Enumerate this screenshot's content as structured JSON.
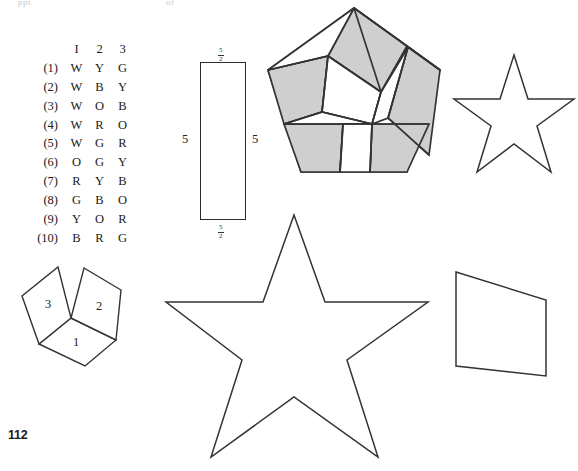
{
  "page": {
    "number": "112",
    "running_head_left": "ppt",
    "running_head_right": "of"
  },
  "code_table": {
    "name": "color-code-table",
    "headers": [
      "",
      "I",
      "2",
      "3"
    ],
    "rows": [
      {
        "label": "(1)",
        "values": [
          "W",
          "Y",
          "G"
        ]
      },
      {
        "label": "(2)",
        "values": [
          "W",
          "B",
          "Y"
        ]
      },
      {
        "label": "(3)",
        "values": [
          "W",
          "O",
          "B"
        ]
      },
      {
        "label": "(4)",
        "values": [
          "W",
          "R",
          "O"
        ]
      },
      {
        "label": "(5)",
        "values": [
          "W",
          "G",
          "R"
        ]
      },
      {
        "label": "(6)",
        "values": [
          "O",
          "G",
          "Y"
        ]
      },
      {
        "label": "(7)",
        "values": [
          "R",
          "Y",
          "B"
        ]
      },
      {
        "label": "(8)",
        "values": [
          "G",
          "B",
          "O"
        ]
      },
      {
        "label": "(9)",
        "values": [
          "Y",
          "O",
          "R"
        ]
      },
      {
        "label": "(10)",
        "values": [
          "B",
          "R",
          "G"
        ]
      }
    ]
  },
  "rectangle": {
    "label_left": "5",
    "label_right": "5",
    "label_top_numerator": "5",
    "label_top_denominator": "2",
    "label_bottom_numerator": "5",
    "label_bottom_denominator": "2"
  },
  "rhombi": {
    "labels": [
      "1",
      "2",
      "3"
    ]
  },
  "colors": {
    "ink": "#2b2b2b",
    "shaded_fill": "#cfcfcf",
    "unshaded_fill": "#ffffff",
    "paper": "#ffffff"
  },
  "figures": [
    {
      "name": "dissected-pentagon",
      "type": "pentagon-dissection",
      "shaded_pieces": 5,
      "unshaded_pieces": 6
    },
    {
      "name": "small-five-pointed-star",
      "type": "star",
      "points": 5
    },
    {
      "name": "large-five-pointed-star",
      "type": "star",
      "points": 5
    },
    {
      "name": "three-rhombi-cluster",
      "type": "rhombi",
      "count": 3
    },
    {
      "name": "leaning-quadrilateral",
      "type": "quadrilateral"
    }
  ]
}
